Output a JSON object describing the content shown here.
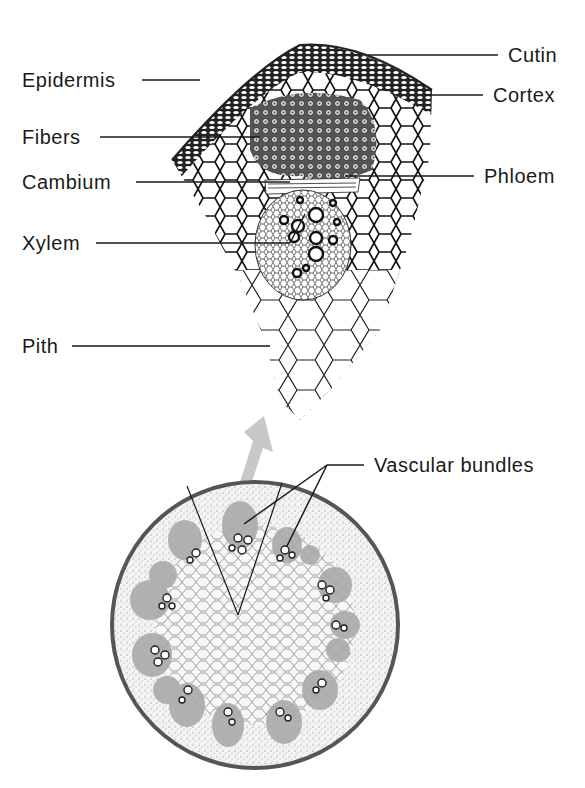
{
  "figure": {
    "type": "botanical cross-section diagram",
    "arrow_color": "#c8c8c8",
    "ink_color": "#1a1a1a",
    "stem_rim_color": "#555555"
  },
  "labels": {
    "epidermis": "Epidermis",
    "fibers": "Fibers",
    "cambium": "Cambium",
    "xylem": "Xylem",
    "pith": "Pith",
    "cutin": "Cutin",
    "cortex": "Cortex",
    "phloem": "Phloem",
    "vascular_bundles": "Vascular bundles"
  }
}
